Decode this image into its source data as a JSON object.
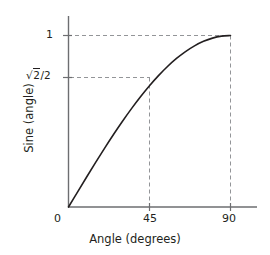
{
  "chart_data": {
    "type": "line",
    "title": "",
    "xlabel": "Angle (degrees)",
    "ylabel": "Sine (angle)",
    "xlim": [
      0,
      90
    ],
    "ylim": [
      0,
      1
    ],
    "xticks": [
      "0",
      "45",
      "90"
    ],
    "xtick_values": [
      0,
      45,
      90
    ],
    "yticks": [
      "1"
    ],
    "ytick_special": "√2/2",
    "ytick_values": [
      1,
      0.7071
    ],
    "grid": false,
    "legend": null,
    "series": [
      {
        "name": "sine",
        "x": [
          0,
          5,
          10,
          15,
          20,
          25,
          30,
          35,
          40,
          45,
          50,
          55,
          60,
          65,
          70,
          75,
          80,
          85,
          90
        ],
        "values": [
          0,
          0.0872,
          0.1736,
          0.2588,
          0.342,
          0.4226,
          0.5,
          0.5736,
          0.6428,
          0.7071,
          0.766,
          0.8192,
          0.866,
          0.9063,
          0.9397,
          0.9659,
          0.9848,
          0.9962,
          1
        ]
      }
    ],
    "annotations": [
      {
        "name": "guide-hline-one",
        "type": "dashed-horizontal",
        "y": 1,
        "x_from": 0,
        "x_to": 90
      },
      {
        "name": "guide-hline-root2over2",
        "type": "dashed-horizontal",
        "y": 0.7071,
        "x_from": 0,
        "x_to": 45
      },
      {
        "name": "guide-vline-45",
        "type": "dashed-vertical",
        "x": 45,
        "y_from": 0,
        "y_to": 0.7071
      },
      {
        "name": "guide-vline-90",
        "type": "dashed-vertical",
        "x": 90,
        "y_from": 0,
        "y_to": 1
      }
    ]
  },
  "axes": {
    "y_tick_one_label": "1",
    "y_tick_root_prefix": "√",
    "y_tick_root_radicand": "2",
    "y_tick_root_suffix": "/2",
    "x_tick_zero_label": "0",
    "x_tick_mid_label": "45",
    "x_tick_max_label": "90",
    "x_title": "Angle (degrees)",
    "y_title": "Sine (angle)"
  },
  "colors": {
    "curve": "#231f20",
    "axis": "#6d6e71",
    "dashed_guide": "#939598",
    "text": "#231f20",
    "background": "#ffffff"
  }
}
